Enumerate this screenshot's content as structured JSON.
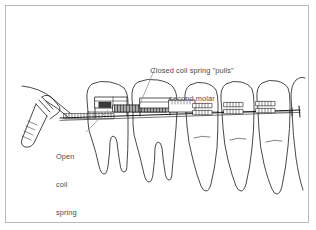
{
  "figure": {
    "kind": "orthodontic-illustration",
    "border_color": "#b9b9b9",
    "background_color": "#ffffff",
    "line_color": "#1a1a1a",
    "text_color": "#4a4a4a"
  },
  "labels": {
    "closed_coil": {
      "name": "closed-coil-spring-label",
      "line1": "Closed coil spring \"pulls\"",
      "line2": "second molar",
      "full": "Closed coil spring \"pulls\" second molar"
    },
    "open_coil": {
      "name": "open-coil-spring-label",
      "line1": "Open",
      "line2": "coil",
      "line3": "spring",
      "line4": "\"holds\"",
      "line5": "first",
      "line6": "molar",
      "full": "Open coil spring \"holds\" first molar"
    }
  },
  "parts": [
    {
      "name": "dental-instrument",
      "label": "ligature director"
    },
    {
      "name": "archwire",
      "label": "archwire"
    },
    {
      "name": "open-coil-spring",
      "label": "open coil spring"
    },
    {
      "name": "closed-coil-spring",
      "label": "closed coil spring"
    },
    {
      "name": "bracket",
      "label": "bracket"
    },
    {
      "name": "molar-tooth",
      "label": "molar"
    },
    {
      "name": "premolar-tooth",
      "label": "premolar"
    },
    {
      "name": "canine-tooth",
      "label": "canine"
    }
  ]
}
